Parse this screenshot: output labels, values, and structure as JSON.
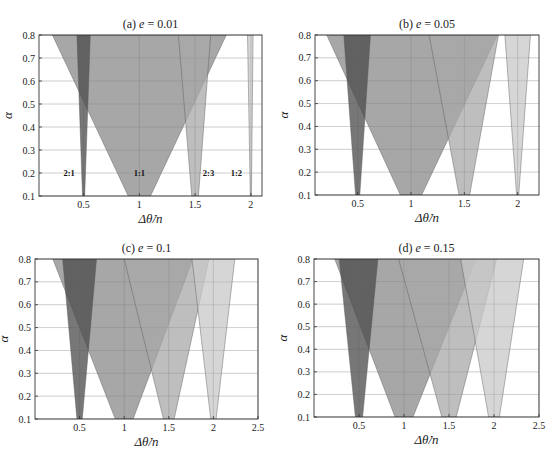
{
  "chart_data": [
    {
      "type": "area",
      "title_prefix": "(a)",
      "title_var": "e",
      "title_value": "= 0.01",
      "xlabel": "Δθ̇/n",
      "ylabel": "α",
      "xlim": [
        0.1,
        2.1
      ],
      "ylim": [
        0.1,
        0.8
      ],
      "xticks": [
        0.5,
        1,
        1.5,
        2
      ],
      "xtick_labels": [
        "0.5",
        "1",
        "1.5",
        "2"
      ],
      "yticks": [
        0.1,
        0.2,
        0.3,
        0.4,
        0.5,
        0.6,
        0.7,
        0.8
      ],
      "ytick_labels": [
        "0.1",
        "0.2",
        "0.3",
        "0.4",
        "0.5",
        "0.6",
        "0.7",
        "0.8"
      ],
      "grid": true,
      "series": [
        {
          "name": "1:1",
          "label": "1:1",
          "bottom": [
            0.9,
            1.1
          ],
          "top": [
            0.22,
            1.78
          ],
          "color": "#8a8a8a",
          "opacity": 0.75,
          "label_pos": [
            1.0,
            0.2
          ]
        },
        {
          "name": "2:1",
          "label": "2:1",
          "bottom": [
            0.49,
            0.51
          ],
          "top": [
            0.44,
            0.56
          ],
          "color": "#4a4a4a",
          "opacity": 0.75,
          "label_pos": [
            0.37,
            0.2
          ]
        },
        {
          "name": "2:3",
          "label": "2:3",
          "bottom": [
            1.47,
            1.53
          ],
          "top": [
            1.35,
            1.64
          ],
          "color": "#a8a8a8",
          "opacity": 0.75,
          "label_pos": [
            1.62,
            0.2
          ]
        },
        {
          "name": "1:2",
          "label": "1:2",
          "bottom": [
            1.995,
            2.005
          ],
          "top": [
            1.97,
            2.02
          ],
          "color": "#c8c8c8",
          "opacity": 0.75,
          "label_pos": [
            1.87,
            0.2
          ]
        }
      ]
    },
    {
      "type": "area",
      "title_prefix": "(b)",
      "title_var": "e",
      "title_value": "= 0.05",
      "xlabel": "Δθ̇/n",
      "ylabel": "α",
      "xlim": [
        0.1,
        2.2
      ],
      "ylim": [
        0.1,
        0.8
      ],
      "xticks": [
        0.5,
        1,
        1.5,
        2
      ],
      "xtick_labels": [
        "0.5",
        "1",
        "1.5",
        "2"
      ],
      "yticks": [
        0.1,
        0.2,
        0.3,
        0.4,
        0.5,
        0.6,
        0.7,
        0.8
      ],
      "ytick_labels": [
        "0.1",
        "0.2",
        "0.3",
        "0.4",
        "0.5",
        "0.6",
        "0.7",
        "0.8"
      ],
      "grid": true,
      "series": [
        {
          "name": "1:1",
          "bottom": [
            0.9,
            1.1
          ],
          "top": [
            0.21,
            1.81
          ],
          "color": "#8a8a8a",
          "opacity": 0.75
        },
        {
          "name": "2:1",
          "bottom": [
            0.48,
            0.52
          ],
          "top": [
            0.37,
            0.62
          ],
          "color": "#4a4a4a",
          "opacity": 0.75
        },
        {
          "name": "2:3",
          "bottom": [
            1.45,
            1.55
          ],
          "top": [
            1.17,
            1.82
          ],
          "color": "#a8a8a8",
          "opacity": 0.75
        },
        {
          "name": "1:2",
          "bottom": [
            1.99,
            2.01
          ],
          "top": [
            1.88,
            2.12
          ],
          "color": "#c8c8c8",
          "opacity": 0.75
        }
      ]
    },
    {
      "type": "area",
      "title_prefix": "(c)",
      "title_var": "e",
      "title_value": "= 0.1",
      "xlabel": "Δθ̇/n",
      "ylabel": "α",
      "xlim": [
        0,
        2.5
      ],
      "ylim": [
        0.1,
        0.8
      ],
      "xticks": [
        0.5,
        1,
        1.5,
        2,
        2.5
      ],
      "xtick_labels": [
        "0.5",
        "1",
        "1.5",
        "2",
        "2.5"
      ],
      "yticks": [
        0.1,
        0.2,
        0.3,
        0.4,
        0.5,
        0.6,
        0.7,
        0.8
      ],
      "ytick_labels": [
        "0.1",
        "0.2",
        "0.3",
        "0.4",
        "0.5",
        "0.6",
        "0.7",
        "0.8"
      ],
      "grid": true,
      "series": [
        {
          "name": "1:1",
          "bottom": [
            0.9,
            1.1
          ],
          "top": [
            0.2,
            1.77
          ],
          "color": "#8a8a8a",
          "opacity": 0.75
        },
        {
          "name": "2:1",
          "bottom": [
            0.47,
            0.53
          ],
          "top": [
            0.31,
            0.69
          ],
          "color": "#4a4a4a",
          "opacity": 0.75
        },
        {
          "name": "2:3",
          "bottom": [
            1.44,
            1.56
          ],
          "top": [
            1.0,
            1.95
          ],
          "color": "#a8a8a8",
          "opacity": 0.75
        },
        {
          "name": "1:2",
          "bottom": [
            1.97,
            2.03
          ],
          "top": [
            1.76,
            2.24
          ],
          "color": "#c8c8c8",
          "opacity": 0.75
        }
      ]
    },
    {
      "type": "area",
      "title_prefix": "(d)",
      "title_var": "e",
      "title_value": "= 0.15",
      "xlabel": "Δθ̇/n",
      "ylabel": "α",
      "xlim": [
        0,
        2.5
      ],
      "ylim": [
        0.1,
        0.8
      ],
      "xticks": [
        0.5,
        1,
        1.5,
        2,
        2.5
      ],
      "xtick_labels": [
        "0.5",
        "1",
        "1.5",
        "2",
        "2.5"
      ],
      "yticks": [
        0.1,
        0.2,
        0.3,
        0.4,
        0.5,
        0.6,
        0.7,
        0.8
      ],
      "ytick_labels": [
        "0.1",
        "0.2",
        "0.3",
        "0.4",
        "0.5",
        "0.6",
        "0.7",
        "0.8"
      ],
      "grid": true,
      "series": [
        {
          "name": "1:1",
          "bottom": [
            0.9,
            1.1
          ],
          "top": [
            0.23,
            1.8
          ],
          "color": "#8a8a8a",
          "opacity": 0.75
        },
        {
          "name": "2:1",
          "bottom": [
            0.46,
            0.54
          ],
          "top": [
            0.28,
            0.71
          ],
          "color": "#4a4a4a",
          "opacity": 0.75
        },
        {
          "name": "2:3",
          "bottom": [
            1.42,
            1.58
          ],
          "top": [
            0.94,
            2.03
          ],
          "color": "#a8a8a8",
          "opacity": 0.75
        },
        {
          "name": "1:2",
          "bottom": [
            1.94,
            2.06
          ],
          "top": [
            1.63,
            2.33
          ],
          "color": "#c8c8c8",
          "opacity": 0.75
        }
      ]
    }
  ]
}
